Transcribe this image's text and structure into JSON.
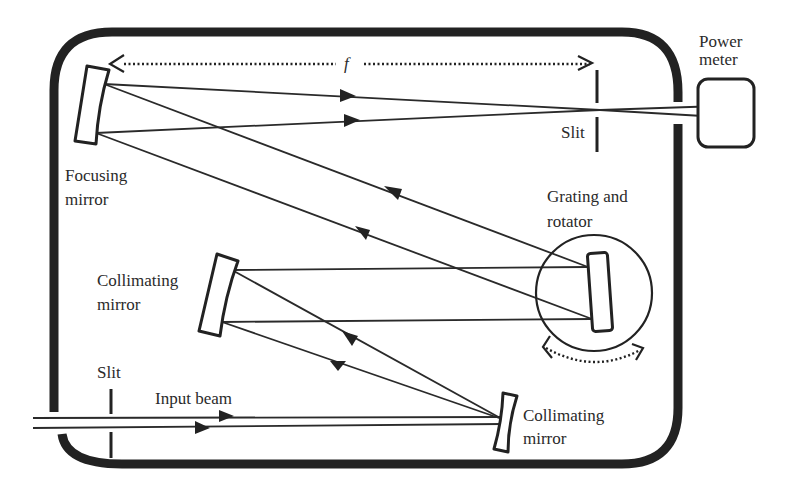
{
  "diagram": {
    "labels": {
      "focal_length": "f",
      "power_meter_line1": "Power",
      "power_meter_line2": "meter",
      "exit_slit": "Slit",
      "focusing_mirror_line1": "Focusing",
      "focusing_mirror_line2": "mirror",
      "grating_line1": "Grating and",
      "grating_line2": "rotator",
      "collimating_mirror_1_line1": "Collimating",
      "collimating_mirror_1_line2": "mirror",
      "entrance_slit": "Slit",
      "input_beam": "Input beam",
      "collimating_mirror_2_line1": "Collimating",
      "collimating_mirror_2_line2": "mirror"
    },
    "components": [
      {
        "id": "focusing-mirror",
        "label": "Focusing mirror"
      },
      {
        "id": "exit-slit",
        "label": "Slit"
      },
      {
        "id": "power-meter",
        "label": "Power meter"
      },
      {
        "id": "grating-rotator",
        "label": "Grating and rotator"
      },
      {
        "id": "collimating-mirror-upper",
        "label": "Collimating mirror"
      },
      {
        "id": "collimating-mirror-lower",
        "label": "Collimating mirror"
      },
      {
        "id": "entrance-slit",
        "label": "Slit"
      }
    ],
    "colors": {
      "stroke": "#222222",
      "text": "#2a2a2a",
      "background": "#ffffff"
    }
  }
}
